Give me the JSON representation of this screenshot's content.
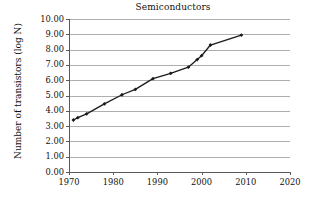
{
  "chart_data": {
    "type": "line",
    "title": "Semiconductors",
    "xlabel": "",
    "ylabel": "Number of transistors (log N)",
    "xlim": [
      1970,
      2020
    ],
    "ylim": [
      0.0,
      10.0
    ],
    "grid": "horizontal",
    "legend": "none",
    "marker": "filled-diamond",
    "line_color": "#1a1a1a",
    "x_ticks": [
      "1970",
      "1980",
      "1990",
      "2000",
      "2010",
      "2020"
    ],
    "x_tick_values": [
      1970,
      1980,
      1990,
      2000,
      2010,
      2020
    ],
    "y_ticks": [
      "0.00",
      "1.00",
      "2.00",
      "3.00",
      "4.00",
      "5.00",
      "6.00",
      "7.00",
      "8.00",
      "9.00",
      "10.00"
    ],
    "y_tick_values": [
      0,
      1,
      2,
      3,
      4,
      5,
      6,
      7,
      8,
      9,
      10
    ],
    "x": [
      1971,
      1972,
      1974,
      1978,
      1982,
      1985,
      1989,
      1993,
      1997,
      1999,
      2000,
      2002,
      2009
    ],
    "values": [
      3.4,
      3.55,
      3.8,
      4.45,
      5.05,
      5.4,
      6.1,
      6.45,
      6.85,
      7.35,
      7.6,
      8.3,
      8.95
    ]
  },
  "figure": {
    "title": "Semiconductors",
    "ylabel": "Number of transistors (log N)"
  }
}
